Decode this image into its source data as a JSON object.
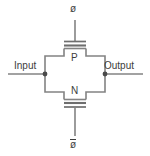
{
  "diagram": {
    "type": "circuit-schematic",
    "background_color": "#ffffff",
    "line_color": "#838383",
    "text_color": "#3d3d3d",
    "width": 150,
    "height": 156
  },
  "labels": {
    "input": "Input",
    "output": "Output",
    "pmos": "P",
    "nmos": "N",
    "clock_top": "ø",
    "clock_bottom": "ø",
    "clock_bottom_is_complement": true
  },
  "nodes": [
    {
      "name": "input-node",
      "x": 45,
      "y": 74
    },
    {
      "name": "output-node",
      "x": 105,
      "y": 74
    }
  ],
  "terminals": [
    {
      "name": "input-terminal",
      "label": "Input",
      "side": "left"
    },
    {
      "name": "output-terminal",
      "label": "Output",
      "side": "right"
    },
    {
      "name": "clock-terminal-top",
      "label": "ø",
      "side": "top"
    },
    {
      "name": "clock-terminal-bottom",
      "label": "ø",
      "side": "bottom"
    }
  ],
  "transistors": [
    {
      "name": "pmos-transistor",
      "label": "P",
      "channel": "p-type",
      "gate": "clock_top"
    },
    {
      "name": "nmos-transistor",
      "label": "N",
      "channel": "n-type",
      "gate": "clock_bottom"
    }
  ]
}
